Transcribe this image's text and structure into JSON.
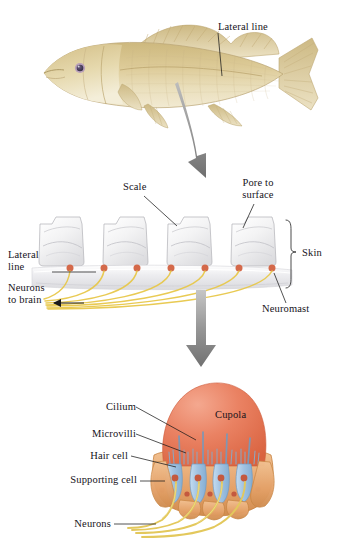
{
  "figure": {
    "background": "#ffffff",
    "width": 343,
    "height": 548
  },
  "colors": {
    "fish_body": "#d6c48d",
    "fish_body_light": "#e8dcb4",
    "fish_belly": "#efe7cd",
    "fish_fin": "#ddcfa2",
    "fish_outline": "#b9a472",
    "eye_ring": "#9a7fa8",
    "eye_pupil": "#3b3147",
    "arrow_gray": "#8d8d8d",
    "arrow_gray_dark": "#6f6f6f",
    "scale_fill": "#f2f2f3",
    "scale_edge": "#bcbcc0",
    "canal_fill": "#e9e9ec",
    "neuromast_dot": "#d4694a",
    "neuron_yellow": "#e8c84a",
    "cupola": "#e8785a",
    "cupola_light": "#f0a089",
    "hair_cell": "#9fc0e0",
    "hair_cell_edge": "#6f9bc4",
    "nucleus": "#c4593f",
    "supporting_cell": "#e8a96f",
    "supporting_cell_edge": "#c98746",
    "cilium": "#7e97b4",
    "leader": "#1a1a1a",
    "text": "#16131a"
  },
  "panels": {
    "fish": {
      "name": "whole-fish",
      "labels": [
        {
          "id": "lateral-line-fish",
          "text": "Lateral line",
          "x": 218,
          "y": 26,
          "align": "left"
        }
      ]
    },
    "skin": {
      "name": "skin-cross-section",
      "labels": [
        {
          "id": "scale",
          "text": "Scale",
          "x": 123,
          "y": 186,
          "align": "left"
        },
        {
          "id": "pore-to-surface",
          "text": "Pore to\nsurface",
          "x": 240,
          "y": 182,
          "align": "left"
        },
        {
          "id": "skin",
          "text": "Skin",
          "x": 310,
          "y": 252,
          "align": "left"
        },
        {
          "id": "lateral-line-skin",
          "text": "Lateral\nline",
          "x": 10,
          "y": 253,
          "align": "left"
        },
        {
          "id": "neurons-to-brain",
          "text": "Neurons\nto brain",
          "x": 10,
          "y": 285,
          "align": "left"
        },
        {
          "id": "neuromast",
          "text": "Neuromast",
          "x": 262,
          "y": 308,
          "align": "left"
        }
      ],
      "neuromast_count": 7,
      "scale_count": 4
    },
    "neuromast": {
      "name": "neuromast-detail",
      "labels": [
        {
          "id": "cupola",
          "text": "Cupola",
          "x": 226,
          "y": 414,
          "align": "left"
        },
        {
          "id": "cilium",
          "text": "Cilium",
          "x": 131,
          "y": 405,
          "align": "right"
        },
        {
          "id": "microvilli",
          "text": "Microvilli",
          "x": 131,
          "y": 432,
          "align": "right"
        },
        {
          "id": "hair-cell",
          "text": "Hair cell",
          "x": 126,
          "y": 453,
          "align": "right"
        },
        {
          "id": "supporting-cell",
          "text": "Supporting cell",
          "x": 135,
          "y": 478,
          "align": "right"
        },
        {
          "id": "neurons",
          "text": "Neurons",
          "x": 109,
          "y": 521,
          "align": "right"
        }
      ],
      "hair_cell_count": 4
    }
  },
  "arrows": [
    {
      "id": "arrow-fish-to-skin",
      "from": "fish",
      "to": "skin"
    },
    {
      "id": "arrow-skin-to-neuromast",
      "from": "skin",
      "to": "neuromast"
    }
  ]
}
